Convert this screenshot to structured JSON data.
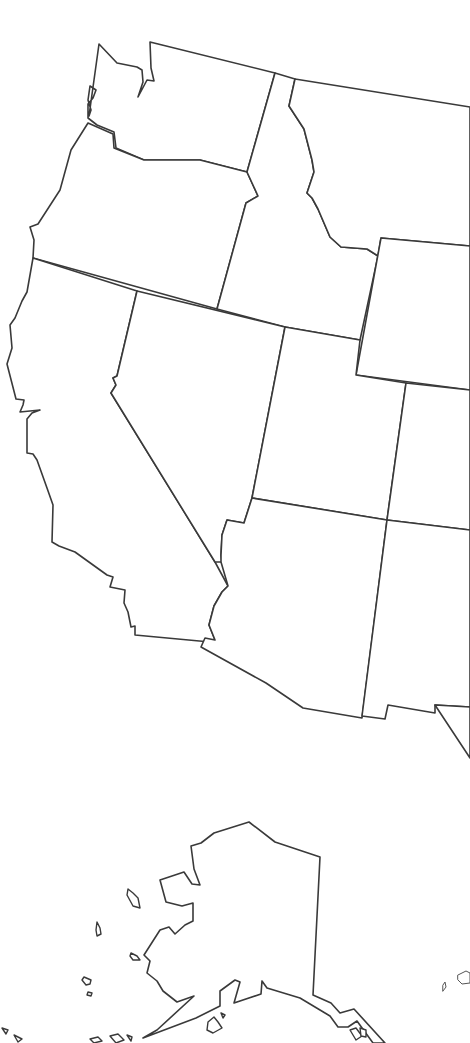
{
  "map": {
    "title": "",
    "stroke_color": "#3a3a3a",
    "background": "#ffffff",
    "regions": [
      {
        "name": "washington",
        "d": "M99,44 L117,63 L137,67 L142,70 L143,82 L138,97 L147,80 L154,81 L151,68 L150,42 L275,73 L247,172 L200,160 L144,160 L116,148 L114,132 L97,125 L88,118 L88,104 L93,98 L96,90 L90,86 L88,100 L91,110 L89,116 Z"
      },
      {
        "name": "oregon",
        "d": "M88,123 L113,134 L114,148 L144,160 L200,160 L247,172 L258,196 L246,203 L217,309 L33,258 L34,240 L30,227 L38,224 L60,190 L71,150 Z"
      },
      {
        "name": "idaho",
        "d": "M275,73 L295,79 L289,106 L304,129 L312,160 L314,172 L307,193 L312,198 L318,209 L330,237 L341,247 L367,249 L378,256 L360,340 L285,327 L217,309 L246,203 L258,196 L247,172 Z"
      },
      {
        "name": "montana",
        "d": "M295,79 L470,107 L470,246 L381,238 L378,256 L367,249 L341,247 L330,237 L318,209 L312,198 L307,193 L314,172 L312,160 L304,129 L289,106 Z"
      },
      {
        "name": "wyoming",
        "d": "M381,238 L470,246 L470,390 L356,375 Z"
      },
      {
        "name": "california",
        "d": "M33,258 L137,291 L117,376 L113,378 L116,385 L111,393 L215,562 L228,586 L222,592 L214,606 L209,625 L215,640 L210,642 L135,635 L135,626 L131,627 L128,612 L124,603 L125,590 L110,587 L113,577 L107,575 L75,552 L59,546 L52,542 L53,505 L47,488 L37,460 L33,454 L27,453 L27,419 L32,413 L40,410 L20,412 L23,405 L24,400 L16,399 L7,364 L12,348 L10,325 L15,318 L22,301 L27,292 Z"
      },
      {
        "name": "nevada",
        "d": "M137,291 L285,327 L252,498 L244,523 L227,520 L222,535 L221,555 L222,562 L215,562 L111,393 L116,385 L113,378 L117,376 Z"
      },
      {
        "name": "utah",
        "d": "M285,327 L360,340 L356,375 L406,383 L387,520 L252,498 Z"
      },
      {
        "name": "colorado",
        "d": "M406,383 L470,390 L470,530 L387,520 Z"
      },
      {
        "name": "arizona",
        "d": "M252,498 L387,520 L362,718 L303,708 L266,683 L201,647 L205,638 L215,640 L209,625 L214,606 L222,592 L228,586 L221,562 L221,555 L222,535 L227,520 L244,523 Z"
      },
      {
        "name": "new-mexico",
        "d": "M387,520 L470,530 L470,707 L435,705 L435,713 L388,705 L385,719 L362,716 Z"
      },
      {
        "name": "texas-edge",
        "d": "M435,705 L470,707 L470,758 Z"
      },
      {
        "name": "alaska",
        "d": "M249,822 L275,842 L320,857 L313,995 L331,1003 L340,1013 L354,1009 L385,1043 L373,1043 L357,1021 L348,1027 L338,1027 L330,1016 L300,998 L267,988 L262,981 L261,994 L234,1003 L240,982 L235,980 L220,991 L220,1006 L196,1018 L143,1038 L157,1030 L194,996 L177,1002 L163,991 L157,981 L147,973 L150,961 L144,955 L160,930 L169,927 L175,934 L185,925 L193,921 L193,903 L182,906 L166,902 L160,880 L184,872 L192,884 L200,885 L194,869 L191,846 L201,843 L214,833 Z"
      }
    ],
    "islands": [
      {
        "name": "st-lawrence-island",
        "d": "M128,889 L133,893 L138,898 L140,908 L133,906 L127,895 Z"
      },
      {
        "name": "nunivak-island",
        "d": "M97,922 L100,928 L101,934 L97,936 L96,930 Z"
      },
      {
        "name": "pribilof-island-1",
        "d": "M131,953 L137,956 L140,960 L133,960 L130,956 Z"
      },
      {
        "name": "pribilof-island-2",
        "d": "M84,977 L91,980 L90,984 L86,985 L82,980 Z"
      },
      {
        "name": "pribilof-island-3",
        "d": "M88,992 L92,993 L91,996 L87,995 Z"
      },
      {
        "name": "kodiak-island",
        "d": "M208,1022 L214,1017 L218,1022 L222,1028 L213,1033 L207,1030 Z"
      },
      {
        "name": "kodiak-island-2",
        "d": "M221,1013 L225,1015 L223,1018 Z"
      },
      {
        "name": "aleutian-1",
        "d": "M2,1028 L8,1030 L6,1034 Z"
      },
      {
        "name": "aleutian-2",
        "d": "M14,1035 L22,1039 L18,1042 Z"
      },
      {
        "name": "aleutian-3",
        "d": "M90,1039 L98,1037 L102,1041 L94,1043 Z"
      },
      {
        "name": "aleutian-4",
        "d": "M110,1036 L118,1034 L124,1040 L116,1043 Z"
      },
      {
        "name": "aleutian-5",
        "d": "M127,1035 L132,1037 L131,1041 Z"
      },
      {
        "name": "southeast-alaska-island-1",
        "d": "M350,1030 L356,1028 L362,1036 L356,1040 Z"
      },
      {
        "name": "southeast-alaska-island-2",
        "d": "M360,1028 L366,1030 L366,1037 L361,1036 Z"
      }
    ],
    "hawaii_fragments": [
      {
        "name": "hawaii-island-1",
        "d": "M443,985 L445,982 L446,987 L443,991 Z"
      },
      {
        "name": "hawaii-island-2",
        "d": "M458,975 L466,971 L470,973 L470,983 L462,984 L458,980 Z"
      }
    ]
  }
}
